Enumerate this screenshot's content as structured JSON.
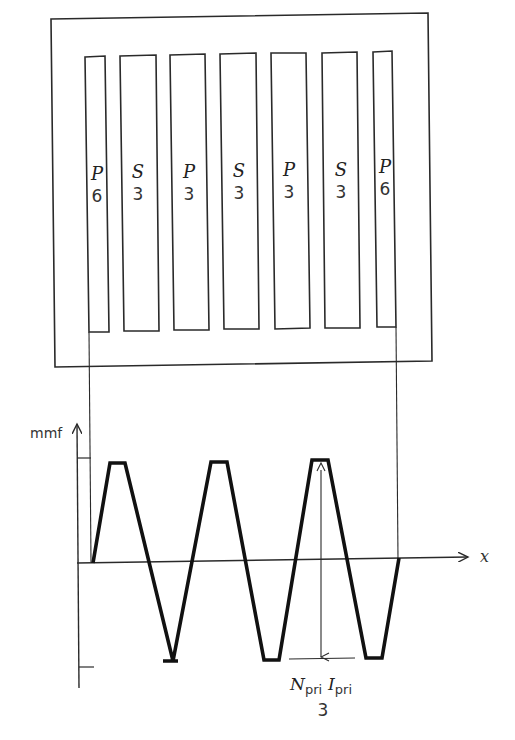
{
  "core": {
    "slots": [
      {
        "letter": "P",
        "turns": "6"
      },
      {
        "letter": "S",
        "turns": "3"
      },
      {
        "letter": "P",
        "turns": "3"
      },
      {
        "letter": "S",
        "turns": "3"
      },
      {
        "letter": "P",
        "turns": "3"
      },
      {
        "letter": "S",
        "turns": "3"
      },
      {
        "letter": "P",
        "turns": "6"
      }
    ]
  },
  "plot": {
    "y_label": "mmf",
    "x_label": "x",
    "amplitude_label": {
      "n_symbol": "N",
      "n_sub": "pri",
      "i_symbol": "I",
      "i_sub": "pri",
      "denominator": "3"
    }
  },
  "colors": {
    "line": "#2a2a2a",
    "waveform": "#111111",
    "background": "#ffffff"
  }
}
